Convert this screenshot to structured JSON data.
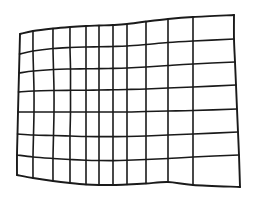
{
  "figure": {
    "title": "Distorted Grid Calibration Pattern",
    "description": "A quadrilateral grid mesh with pincushion-style curvature, drawn as thin dark lines on a white background.",
    "pattern_type": "warped-grid",
    "columns": 10,
    "rows": 7,
    "line_color": "#1a1a1a",
    "background_color": "#ffffff",
    "line_width_px": 1.6,
    "canvas": {
      "width": 253,
      "height": 200
    }
  },
  "chart_data": {
    "type": "scatter",
    "title": "Distorted Grid Calibration Pattern",
    "xlabel": "",
    "ylabel": "",
    "xlim": [
      0,
      253
    ],
    "ylim": [
      0,
      200
    ],
    "grid": true,
    "legend": "none",
    "annotations": [],
    "corners": {
      "top_left": [
        20,
        34
      ],
      "top_right": [
        234,
        15
      ],
      "bottom_right": [
        240,
        187
      ],
      "bottom_left": [
        17,
        175
      ]
    },
    "columns": 10,
    "rows": 7,
    "mesh_points": [
      [
        [
          20,
          34
        ],
        [
          33,
          31
        ],
        [
          53,
          28.5
        ],
        [
          70,
          27
        ],
        [
          86,
          26
        ],
        [
          99,
          25.5
        ],
        [
          113,
          25
        ],
        [
          127,
          24
        ],
        [
          146,
          21.5
        ],
        [
          168,
          19
        ],
        [
          193,
          17
        ],
        [
          234,
          15
        ]
      ],
      [
        [
          19.5,
          54
        ],
        [
          33,
          51
        ],
        [
          53,
          48.5
        ],
        [
          70,
          47.5
        ],
        [
          86,
          47
        ],
        [
          99,
          46.8
        ],
        [
          113,
          46.5
        ],
        [
          127,
          46
        ],
        [
          146,
          44.5
        ],
        [
          168,
          42.5
        ],
        [
          193,
          41
        ],
        [
          234,
          39
        ]
      ],
      [
        [
          19,
          73
        ],
        [
          33.5,
          71
        ],
        [
          53.5,
          69.5
        ],
        [
          70.5,
          69
        ],
        [
          86,
          68.8
        ],
        [
          99,
          68.6
        ],
        [
          113,
          68.4
        ],
        [
          127,
          68
        ],
        [
          146,
          67
        ],
        [
          168,
          65.5
        ],
        [
          193,
          64
        ],
        [
          235,
          62
        ]
      ],
      [
        [
          18.5,
          92
        ],
        [
          34,
          91
        ],
        [
          54,
          90.5
        ],
        [
          70.5,
          90.3
        ],
        [
          86,
          90.2
        ],
        [
          99,
          90
        ],
        [
          113,
          89.8
        ],
        [
          127,
          89.5
        ],
        [
          146,
          89
        ],
        [
          168,
          88
        ],
        [
          193,
          87
        ],
        [
          236,
          85
        ]
      ],
      [
        [
          18,
          112
        ],
        [
          34,
          112
        ],
        [
          54,
          112
        ],
        [
          70.5,
          112
        ],
        [
          86,
          112
        ],
        [
          99,
          112
        ],
        [
          113,
          112
        ],
        [
          127,
          112
        ],
        [
          146,
          111.5
        ],
        [
          168,
          111
        ],
        [
          193,
          110.5
        ],
        [
          237,
          109
        ]
      ],
      [
        [
          17.5,
          134
        ],
        [
          33.5,
          135
        ],
        [
          53.5,
          135.5
        ],
        [
          70,
          136
        ],
        [
          86,
          136.5
        ],
        [
          99,
          136.6
        ],
        [
          113,
          136.6
        ],
        [
          127,
          136.5
        ],
        [
          146,
          136
        ],
        [
          168,
          135
        ],
        [
          193,
          134
        ],
        [
          238,
          132
        ]
      ],
      [
        [
          17,
          155
        ],
        [
          33,
          157
        ],
        [
          53,
          158.5
        ],
        [
          70,
          159.5
        ],
        [
          86,
          160.2
        ],
        [
          99,
          160.5
        ],
        [
          113,
          160.6
        ],
        [
          127,
          160.3
        ],
        [
          146,
          159.5
        ],
        [
          168,
          158.5
        ],
        [
          193,
          157
        ],
        [
          239,
          155
        ]
      ],
      [
        [
          17,
          175
        ],
        [
          33,
          178
        ],
        [
          53,
          181
        ],
        [
          70,
          183
        ],
        [
          86,
          184.5
        ],
        [
          99,
          185
        ],
        [
          113,
          185
        ],
        [
          127,
          184.5
        ],
        [
          146,
          183.5
        ],
        [
          168,
          182
        ],
        [
          193,
          185
        ],
        [
          240,
          187
        ]
      ]
    ]
  }
}
